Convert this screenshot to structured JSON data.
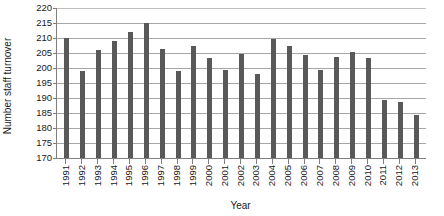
{
  "chart_data": {
    "type": "bar",
    "title": "",
    "subtitle": "",
    "xlabel": "Year",
    "ylabel": "Number staff turnover",
    "ylim": [
      170,
      220
    ],
    "ytick_step": 5,
    "yticks": [
      220,
      215,
      210,
      205,
      200,
      195,
      190,
      185,
      180,
      175,
      170
    ],
    "grid": true,
    "legend": null,
    "bar_color": "#595959",
    "axis_color": "#808080",
    "gridline_color": "#a6a6a6",
    "categories": [
      "1991",
      "1992",
      "1993",
      "1994",
      "1995",
      "1996",
      "1997",
      "1998",
      "1999",
      "2000",
      "2001",
      "2002",
      "2003",
      "2004",
      "2005",
      "2006",
      "2007",
      "2008",
      "2009",
      "2010",
      "2011",
      "2012",
      "2013"
    ],
    "values": [
      210,
      199,
      206,
      209,
      212,
      215,
      206.5,
      199,
      207.5,
      203.5,
      199.5,
      204.8,
      198,
      209.8,
      207.5,
      204.5,
      199.5,
      203.8,
      205.5,
      203.5,
      189.5,
      188.8,
      184.5
    ]
  }
}
